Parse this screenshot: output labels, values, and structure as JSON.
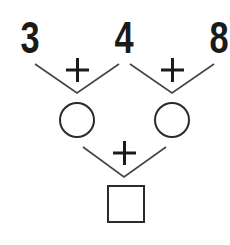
{
  "puzzle": {
    "top_numbers": [
      "3",
      "4",
      "8"
    ],
    "operators": {
      "left_top": "+",
      "right_top": "+",
      "bottom": "+"
    },
    "middle_placeholders": [
      {
        "shape": "circle",
        "value": ""
      },
      {
        "shape": "circle",
        "value": ""
      }
    ],
    "result_placeholder": {
      "shape": "square",
      "value": ""
    }
  },
  "colors": {
    "ink": "#1a1a1a",
    "line": "#444444",
    "background": "#ffffff"
  }
}
